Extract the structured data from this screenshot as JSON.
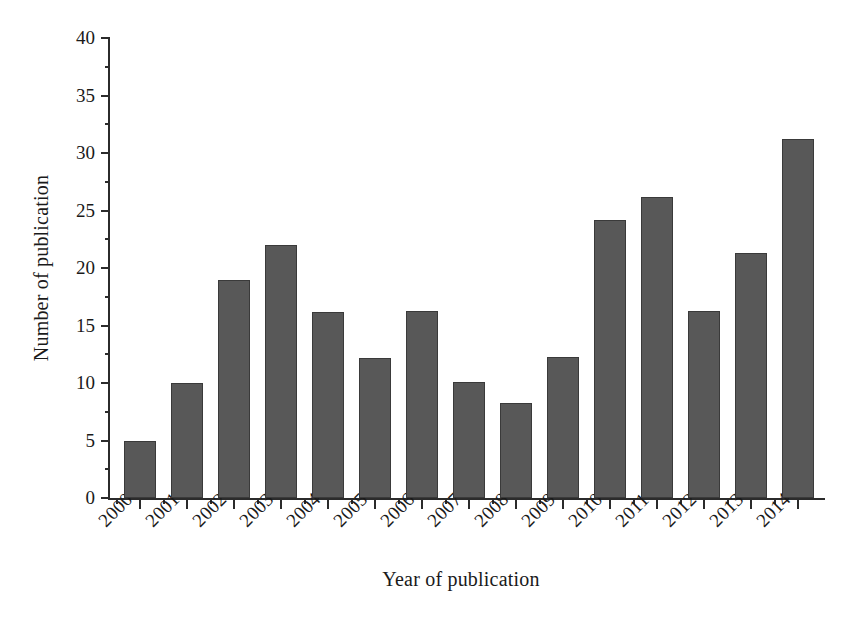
{
  "chart_data": {
    "type": "bar",
    "title": "",
    "xlabel": "Year of publication",
    "ylabel": "Number of publication",
    "categories": [
      "2000",
      "2001",
      "2002",
      "2003",
      "2004",
      "2005",
      "2006",
      "2007",
      "2008",
      "2009",
      "2010",
      "2011",
      "2012",
      "2013",
      "2014"
    ],
    "values": [
      5.0,
      10.0,
      19.0,
      22.0,
      16.2,
      12.2,
      16.3,
      10.1,
      8.3,
      12.3,
      24.2,
      26.2,
      16.3,
      21.3,
      31.2
    ],
    "ylim": [
      0,
      40
    ],
    "ytick_labels": [
      "0",
      "5",
      "10",
      "15",
      "20",
      "25",
      "30",
      "35",
      "40"
    ],
    "ytick_values": [
      0,
      5,
      10,
      15,
      20,
      25,
      30,
      35,
      40
    ],
    "yminor_values": [
      2.5,
      7.5,
      12.5,
      17.5,
      22.5,
      27.5,
      32.5,
      37.5
    ],
    "grid": false,
    "legend": null,
    "bar_color": "#585858",
    "bar_edge_color": "#3a3a3a",
    "axis_color": "#2b2b2b",
    "background_color": "#ffffff",
    "xtick_rotation": -45
  }
}
